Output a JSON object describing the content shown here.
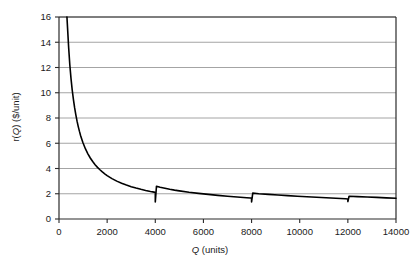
{
  "chart_data": {
    "type": "line",
    "title": "",
    "subtitle": "",
    "xlabel_plain": "Q (units)",
    "xlabel_italic_part": "Q",
    "xlabel_rest": " (units)",
    "ylabel_plain": "r(Q) ($/unit)",
    "ylabel_prefix": "r(",
    "ylabel_italic_part": "Q",
    "ylabel_suffix": ") ($/unit)",
    "xlim": [
      0,
      14000
    ],
    "ylim": [
      0,
      16
    ],
    "xticks": [
      0,
      2000,
      4000,
      6000,
      8000,
      10000,
      12000,
      14000
    ],
    "xtick_labels": [
      "0",
      "2000",
      "4000",
      "6000",
      "8000",
      "10000",
      "12000",
      "14000"
    ],
    "yticks": [
      0,
      2,
      4,
      6,
      8,
      10,
      12,
      14,
      16
    ],
    "ytick_labels": [
      "0",
      "2",
      "4",
      "6",
      "8",
      "10",
      "12",
      "14",
      "16"
    ],
    "grid": "horizontal",
    "grid_color": "#9a9a9a",
    "line_color": "#000000",
    "line_width": 1.6,
    "legend": null,
    "legend_position": "none",
    "series": [
      {
        "name": "r(Q)",
        "description": "Replenishment cost per unit: hyperbolic decay with sawtooth resets at each 4000-unit order multiple",
        "breakpoints": [
          4000,
          8000,
          12000
        ],
        "segment_peaks": [
          16.0,
          2.6,
          2.05,
          1.8
        ],
        "segment_minima": [
          1.35,
          1.35,
          1.38,
          1.6
        ],
        "points": [
          [
            330,
            16.0
          ],
          [
            400,
            13.6
          ],
          [
            450,
            12.2
          ],
          [
            500,
            11.1
          ],
          [
            550,
            10.2
          ],
          [
            600,
            9.45
          ],
          [
            650,
            8.8
          ],
          [
            700,
            8.25
          ],
          [
            750,
            7.75
          ],
          [
            800,
            7.32
          ],
          [
            850,
            6.94
          ],
          [
            900,
            6.6
          ],
          [
            950,
            6.3
          ],
          [
            1000,
            6.02
          ],
          [
            1100,
            5.55
          ],
          [
            1200,
            5.16
          ],
          [
            1300,
            4.83
          ],
          [
            1400,
            4.55
          ],
          [
            1500,
            4.3
          ],
          [
            1600,
            4.09
          ],
          [
            1700,
            3.9
          ],
          [
            1800,
            3.73
          ],
          [
            1900,
            3.58
          ],
          [
            2000,
            3.44
          ],
          [
            2200,
            3.2
          ],
          [
            2400,
            3.0
          ],
          [
            2600,
            2.83
          ],
          [
            2800,
            2.69
          ],
          [
            3000,
            2.56
          ],
          [
            3200,
            2.45
          ],
          [
            3400,
            2.35
          ],
          [
            3600,
            2.26
          ],
          [
            3800,
            2.18
          ],
          [
            3950,
            2.13
          ],
          [
            4000,
            2.1
          ],
          [
            4000,
            1.35
          ],
          [
            4050,
            2.6
          ],
          [
            4200,
            2.52
          ],
          [
            4400,
            2.44
          ],
          [
            4600,
            2.36
          ],
          [
            4800,
            2.29
          ],
          [
            5000,
            2.23
          ],
          [
            5400,
            2.12
          ],
          [
            5800,
            2.03
          ],
          [
            6200,
            1.95
          ],
          [
            6600,
            1.87
          ],
          [
            7000,
            1.8
          ],
          [
            7400,
            1.74
          ],
          [
            7800,
            1.68
          ],
          [
            7950,
            1.66
          ],
          [
            8000,
            1.65
          ],
          [
            8000,
            1.35
          ],
          [
            8050,
            2.05
          ],
          [
            8300,
            2.0
          ],
          [
            8700,
            1.95
          ],
          [
            9100,
            1.9
          ],
          [
            9500,
            1.85
          ],
          [
            9900,
            1.8
          ],
          [
            10300,
            1.76
          ],
          [
            10700,
            1.72
          ],
          [
            11100,
            1.68
          ],
          [
            11500,
            1.64
          ],
          [
            11900,
            1.6
          ],
          [
            12000,
            1.59
          ],
          [
            12000,
            1.38
          ],
          [
            12050,
            1.8
          ],
          [
            12400,
            1.77
          ],
          [
            12800,
            1.74
          ],
          [
            13200,
            1.71
          ],
          [
            13600,
            1.67
          ],
          [
            14000,
            1.64
          ]
        ]
      }
    ]
  }
}
